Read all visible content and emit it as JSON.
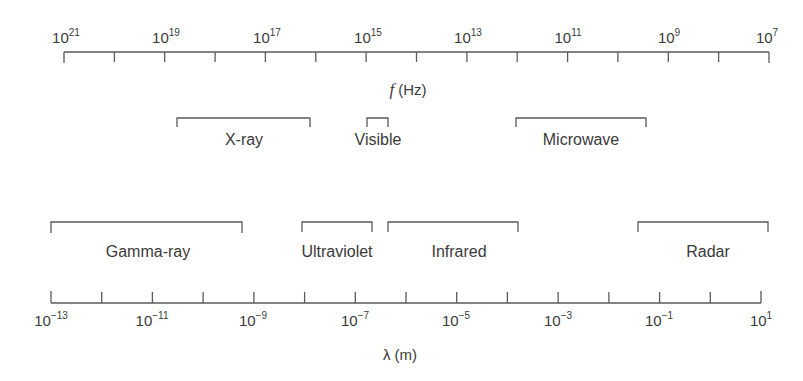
{
  "frequency_axis": {
    "title_symbol": "f",
    "title_unit": "(Hz)",
    "labels": [
      {
        "base": "10",
        "exp": "21"
      },
      {
        "base": "10",
        "exp": "19"
      },
      {
        "base": "10",
        "exp": "17"
      },
      {
        "base": "10",
        "exp": "15"
      },
      {
        "base": "10",
        "exp": "13"
      },
      {
        "base": "10",
        "exp": "11"
      },
      {
        "base": "10",
        "exp": "9"
      },
      {
        "base": "10",
        "exp": "7"
      }
    ],
    "tick_count": 15
  },
  "wavelength_axis": {
    "title_symbol": "λ",
    "title_unit": "(m)",
    "labels": [
      {
        "base": "10",
        "exp": "−13"
      },
      {
        "base": "10",
        "exp": "−11"
      },
      {
        "base": "10",
        "exp": "−9"
      },
      {
        "base": "10",
        "exp": "−7"
      },
      {
        "base": "10",
        "exp": "−5"
      },
      {
        "base": "10",
        "exp": "−3"
      },
      {
        "base": "10",
        "exp": "−1"
      },
      {
        "base": "10",
        "exp": "1"
      }
    ],
    "tick_count": 15
  },
  "bands_upper": [
    {
      "name": "X-ray"
    },
    {
      "name": "Visible"
    },
    {
      "name": "Microwave"
    }
  ],
  "bands_lower": [
    {
      "name": "Gamma-ray"
    },
    {
      "name": "Ultraviolet"
    },
    {
      "name": "Infrared"
    },
    {
      "name": "Radar"
    }
  ],
  "colors": {
    "line": "#5a5a5a",
    "text": "#3a3a3a"
  }
}
